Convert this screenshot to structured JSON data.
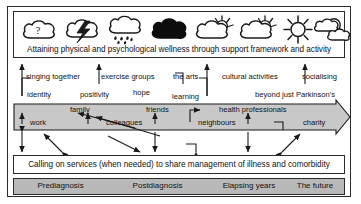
{
  "figure": {
    "wellness_caption": "Attaining physical and psychological wellness through support framework and activity",
    "services_caption": "Calling on services (when needed) to share management of illness and comorbidity"
  },
  "weather_icons": [
    {
      "name": "cloud-question-icon",
      "meaning": "cloud with question mark"
    },
    {
      "name": "cloud-lightning-icon",
      "meaning": "cloud with lightning bolt"
    },
    {
      "name": "cloud-rain-icon",
      "meaning": "cloud with rain"
    },
    {
      "name": "cloud-dark-icon",
      "meaning": "solid black storm cloud"
    },
    {
      "name": "cloud-sun-behind-icon",
      "meaning": "cloud with sun partly behind"
    },
    {
      "name": "cloud-sun-behind-icon-2",
      "meaning": "cloud with sun partly behind"
    },
    {
      "name": "sun-icon",
      "meaning": "full sun"
    },
    {
      "name": "sun-clouds-icon",
      "meaning": "sun with two clouds"
    }
  ],
  "activities_row": [
    {
      "label": "singing together"
    },
    {
      "label": "exercise groups"
    },
    {
      "label": "the arts"
    },
    {
      "label": "cultural activities"
    },
    {
      "label": "socialising"
    }
  ],
  "values_row": [
    {
      "label": "identity"
    },
    {
      "label": "positivity"
    },
    {
      "label": "hope"
    },
    {
      "label": "learning"
    },
    {
      "label": "beyond just Parkinson's"
    }
  ],
  "support_network": {
    "upper": [
      {
        "label": "family"
      },
      {
        "label": "friends"
      },
      {
        "label": "health professionals"
      }
    ],
    "lower": [
      {
        "label": "work"
      },
      {
        "label": "colleagues"
      },
      {
        "label": "neighbours"
      },
      {
        "label": "charity"
      }
    ]
  },
  "timeline": [
    {
      "label": "Prediagnosis"
    },
    {
      "label": "Postdiagnosis"
    },
    {
      "label": "Elapsing years"
    },
    {
      "label": "The future"
    }
  ],
  "colors": {
    "stroke": "#2b2b2b",
    "band_fill": "#c8c8c8",
    "timeline_fill": "#b9b9b9",
    "background": "#ffffff"
  }
}
